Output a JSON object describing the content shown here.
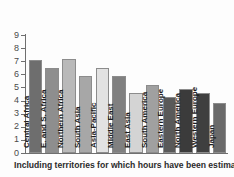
{
  "chart_data": {
    "type": "bar",
    "title": "",
    "subtitle": "",
    "xlabel": "",
    "ylabel": "",
    "ylim": [
      0,
      9
    ],
    "grid": false,
    "legend": "none",
    "y_ticks": [
      "0",
      "1",
      "2",
      "3",
      "4",
      "5",
      "6",
      "7",
      "8",
      "9"
    ],
    "categories": [
      "Central Africa",
      "E. and S. Africa",
      "Northern Africa",
      "South Asia",
      "Asia-Pacific",
      "Middle East",
      "East Asia",
      "South America",
      "Eastern Europe",
      "North America",
      "Western Europe",
      "Japan"
    ],
    "values": [
      7.1,
      6.5,
      7.2,
      5.9,
      6.5,
      5.85,
      4.6,
      5.15,
      4.25,
      4.85,
      4.55,
      3.8
    ],
    "bar_colors": [
      "#6e6e6e",
      "#8e8e8e",
      "#b9b9b9",
      "#a7a7a7",
      "#e2e2e2",
      "#808080",
      "#d4d4d4",
      "#a0a0a0",
      "#595959",
      "#3b3b3b",
      "#3f3f3f",
      "#6a6a6a"
    ],
    "annotation": "Including territories for which hours have been estimated."
  },
  "footnote": {
    "text": "Including territories for which hours have been estimated."
  },
  "axis": {
    "border_color": "#6f6f6f",
    "tick_color": "#6f6f6f",
    "label_color": "#4a4a4a"
  }
}
